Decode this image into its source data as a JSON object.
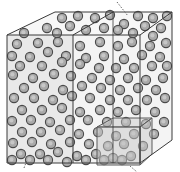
{
  "diagram": {
    "title": "",
    "colors": {
      "background": "#ffffff",
      "cube_face": "#f4f4f4",
      "cube_face_left": "#e9e9e9",
      "cube_top": "#f7f7f7",
      "edge": "#3a3a3a",
      "particle_fill": "#a9a9a9",
      "particle_stroke": "#4a4a4a",
      "particle_highlight": "#d2d2d2",
      "subcube_fill": "#c8c8c8",
      "subcube_edge": "#5a5a5a",
      "leader": "#666666"
    },
    "big_cube": {
      "front": [
        [
          7,
          35
        ],
        [
          140,
          35
        ],
        [
          140,
          163
        ],
        [
          7,
          163
        ]
      ],
      "back": [
        [
          55,
          12
        ],
        [
          172,
          12
        ],
        [
          172,
          140
        ],
        [
          55,
          140
        ]
      ],
      "divider_front_x": 73,
      "divider_back_x": 113
    },
    "sub_cube": {
      "front": [
        [
          97,
          127
        ],
        [
          140,
          127
        ],
        [
          140,
          165
        ],
        [
          97,
          165
        ]
      ],
      "back": [
        [
          113,
          118
        ],
        [
          152,
          118
        ],
        [
          152,
          154
        ],
        [
          113,
          154
        ]
      ]
    },
    "leaders": [
      [
        [
          117,
          2
        ],
        [
          128,
          16
        ]
      ],
      [
        [
          24,
          168
        ],
        [
          27,
          160
        ]
      ],
      [
        [
          130,
          166
        ],
        [
          137,
          172
        ]
      ]
    ],
    "particles": [
      [
        62,
        18
      ],
      [
        78,
        16
      ],
      [
        95,
        18
      ],
      [
        110,
        15
      ],
      [
        124,
        24
      ],
      [
        138,
        16
      ],
      [
        153,
        18
      ],
      [
        167,
        16
      ],
      [
        47,
        28
      ],
      [
        70,
        26
      ],
      [
        86,
        30
      ],
      [
        104,
        28
      ],
      [
        118,
        30
      ],
      [
        145,
        26
      ],
      [
        161,
        28
      ],
      [
        24,
        33
      ],
      [
        57,
        33
      ],
      [
        133,
        33
      ],
      [
        153,
        36
      ],
      [
        17,
        44
      ],
      [
        38,
        43
      ],
      [
        58,
        42
      ],
      [
        80,
        46
      ],
      [
        100,
        42
      ],
      [
        118,
        46
      ],
      [
        132,
        42
      ],
      [
        150,
        46
      ],
      [
        166,
        43
      ],
      [
        12,
        56
      ],
      [
        30,
        57
      ],
      [
        48,
        52
      ],
      [
        66,
        56
      ],
      [
        86,
        58
      ],
      [
        104,
        56
      ],
      [
        124,
        59
      ],
      [
        142,
        55
      ],
      [
        160,
        57
      ],
      [
        20,
        66
      ],
      [
        42,
        66
      ],
      [
        62,
        62
      ],
      [
        80,
        64
      ],
      [
        99,
        68
      ],
      [
        116,
        68
      ],
      [
        134,
        68
      ],
      [
        152,
        66
      ],
      [
        167,
        66
      ],
      [
        13,
        75
      ],
      [
        33,
        78
      ],
      [
        54,
        74
      ],
      [
        71,
        76
      ],
      [
        92,
        78
      ],
      [
        110,
        80
      ],
      [
        128,
        78
      ],
      [
        146,
        80
      ],
      [
        163,
        78
      ],
      [
        24,
        88
      ],
      [
        44,
        86
      ],
      [
        63,
        90
      ],
      [
        82,
        86
      ],
      [
        101,
        88
      ],
      [
        120,
        90
      ],
      [
        138,
        88
      ],
      [
        156,
        90
      ],
      [
        14,
        98
      ],
      [
        34,
        98
      ],
      [
        53,
        100
      ],
      [
        72,
        96
      ],
      [
        90,
        98
      ],
      [
        110,
        100
      ],
      [
        128,
        100
      ],
      [
        147,
        100
      ],
      [
        165,
        98
      ],
      [
        22,
        110
      ],
      [
        42,
        110
      ],
      [
        62,
        108
      ],
      [
        80,
        112
      ],
      [
        100,
        110
      ],
      [
        118,
        112
      ],
      [
        136,
        110
      ],
      [
        155,
        112
      ],
      [
        12,
        121
      ],
      [
        31,
        120
      ],
      [
        50,
        122
      ],
      [
        70,
        120
      ],
      [
        88,
        120
      ],
      [
        107,
        122
      ],
      [
        126,
        122
      ],
      [
        146,
        124
      ],
      [
        164,
        122
      ],
      [
        22,
        132
      ],
      [
        41,
        132
      ],
      [
        60,
        130
      ],
      [
        79,
        134
      ],
      [
        98,
        132
      ],
      [
        116,
        136
      ],
      [
        134,
        134
      ],
      [
        154,
        134
      ],
      [
        13,
        143
      ],
      [
        32,
        142
      ],
      [
        51,
        144
      ],
      [
        70,
        142
      ],
      [
        89,
        144
      ],
      [
        108,
        146
      ],
      [
        124,
        144
      ],
      [
        143,
        146
      ],
      [
        21,
        154
      ],
      [
        40,
        154
      ],
      [
        58,
        152
      ],
      [
        77,
        156
      ],
      [
        96,
        154
      ],
      [
        113,
        158
      ],
      [
        131,
        156
      ],
      [
        12,
        160
      ],
      [
        30,
        160
      ],
      [
        48,
        160
      ],
      [
        67,
        162
      ],
      [
        86,
        160
      ],
      [
        104,
        160
      ],
      [
        122,
        160
      ]
    ]
  }
}
